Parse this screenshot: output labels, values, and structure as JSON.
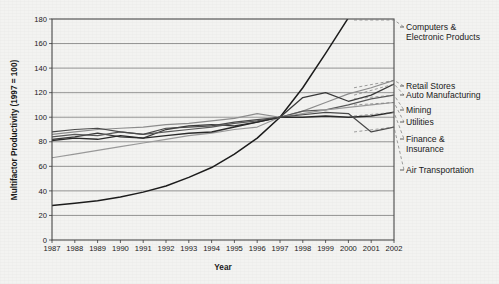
{
  "chart_data": {
    "type": "line",
    "title": "",
    "xlabel": "Year",
    "ylabel": "Multifactor Productivity (1997 = 100)",
    "xlim": [
      1987,
      2002
    ],
    "ylim": [
      0,
      180
    ],
    "ytick_step": 20,
    "grid": true,
    "legend_position": "right-labels-at-line-ends",
    "categories": [
      1987,
      1988,
      1989,
      1990,
      1991,
      1992,
      1993,
      1994,
      1995,
      1996,
      1997,
      1998,
      1999,
      2000,
      2001,
      2002
    ],
    "x_tick_labels": [
      "1987",
      "1988",
      "1989",
      "1990",
      "1991",
      "1992",
      "1993",
      "1994",
      "1995",
      "1996",
      "1997",
      "1998",
      "1999",
      "2000",
      "2001",
      "2002"
    ],
    "y_tick_labels": [
      "0",
      "20",
      "40",
      "60",
      "80",
      "100",
      "120",
      "140",
      "160",
      "180"
    ],
    "series": [
      {
        "name": "Computers & Electronic Products",
        "color": "#1c1c1c",
        "width": 1.5,
        "values": [
          28,
          30,
          32,
          35,
          39,
          44,
          51,
          59,
          70,
          83,
          100,
          124,
          152,
          181,
          196,
          212
        ],
        "clipped_above_ylim": true
      },
      {
        "name": "Retail Stores",
        "color": "#8e8e8e",
        "width": 1.2,
        "values": [
          86,
          88,
          90,
          91,
          92,
          94,
          95,
          97,
          99,
          103,
          100,
          105,
          112,
          119,
          124,
          130
        ]
      },
      {
        "name": "Auto Manufacturing",
        "color": "#3a3a3a",
        "width": 1.3,
        "values": [
          82,
          84,
          87,
          84,
          83,
          90,
          93,
          94,
          93,
          96,
          100,
          116,
          120,
          113,
          118,
          127
        ]
      },
      {
        "name": "Mining",
        "color": "#5a5a5a",
        "width": 1.2,
        "values": [
          84,
          86,
          85,
          88,
          86,
          88,
          90,
          92,
          95,
          97,
          100,
          105,
          106,
          110,
          115,
          118
        ]
      },
      {
        "name": "Utilities",
        "color": "#9a9a9a",
        "width": 1.2,
        "values": [
          67,
          70,
          73,
          76,
          79,
          82,
          85,
          87,
          90,
          92,
          100,
          103,
          106,
          108,
          110,
          112
        ]
      },
      {
        "name": "Finance & Insurance",
        "color": "#2a2a2a",
        "width": 1.4,
        "values": [
          81,
          83,
          82,
          85,
          83,
          85,
          87,
          88,
          92,
          96,
          100,
          100,
          101,
          100,
          101,
          104
        ]
      },
      {
        "name": "Air Transportation",
        "color": "#4a4a4a",
        "width": 1.2,
        "values": [
          88,
          90,
          91,
          88,
          86,
          91,
          92,
          93,
          96,
          98,
          100,
          102,
          104,
          103,
          88,
          92
        ]
      }
    ],
    "legend_entries": [
      {
        "label_line1": "Computers &",
        "label_line2": "Electronic Products"
      },
      {
        "label_line1": "Retail Stores",
        "label_line2": ""
      },
      {
        "label_line1": "Auto Manufacturing",
        "label_line2": ""
      },
      {
        "label_line1": "Mining",
        "label_line2": ""
      },
      {
        "label_line1": "Utilities",
        "label_line2": ""
      },
      {
        "label_line1": "Finance &",
        "label_line2": "Insurance"
      },
      {
        "label_line1": "Air Transportation",
        "label_line2": ""
      }
    ]
  }
}
